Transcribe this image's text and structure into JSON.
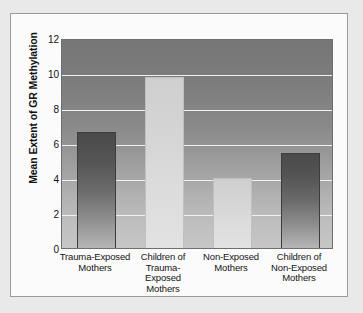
{
  "figure": {
    "background_color": "#e9e9e9",
    "card_color": "#fbfbfb",
    "border_color": "#9a9a9a"
  },
  "chart_data": {
    "type": "bar",
    "title": "",
    "xlabel": "",
    "ylabel": "Mean Extent of GR Methylation",
    "ylim": [
      0,
      12
    ],
    "yticks": [
      0,
      2,
      4,
      6,
      8,
      10,
      12
    ],
    "ytick_labels": [
      "0",
      "2",
      "4",
      "6",
      "8",
      "10",
      "12"
    ],
    "grid": true,
    "grid_color": "#f2f2f2",
    "legend": null,
    "categories": [
      "Trauma-Exposed Mothers",
      "Children of Trauma-Exposed Mothers",
      "Non-Exposed Mothers",
      "Children of Non-Exposed Mothers"
    ],
    "category_lines": [
      [
        "Trauma-Exposed",
        "Mothers"
      ],
      [
        "Children of",
        "Trauma-",
        "Exposed",
        "Mothers"
      ],
      [
        "Non-Exposed",
        "Mothers"
      ],
      [
        "Children of",
        "Non-Exposed",
        "Mothers"
      ]
    ],
    "values": [
      6.65,
      9.8,
      4.0,
      5.45
    ],
    "bar_styles": [
      "dark",
      "light",
      "light",
      "dark"
    ],
    "bar_colors": [
      "#4a4a4a",
      "#cfcfcf",
      "#cfcfcf",
      "#4a4a4a"
    ],
    "plot_background": "gray-vertical-gradient"
  }
}
